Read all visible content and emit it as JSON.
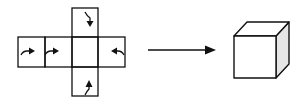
{
  "diagram": {
    "net": {
      "faces": [
        {
          "id": "top",
          "arrow": "curved-down"
        },
        {
          "id": "far-left",
          "arrow": "curved-right"
        },
        {
          "id": "left",
          "arrow": "curved-right"
        },
        {
          "id": "center",
          "arrow": "none"
        },
        {
          "id": "right",
          "arrow": "curved-left"
        },
        {
          "id": "bottom",
          "arrow": "curved-up"
        }
      ]
    },
    "transition_arrow": "right-arrow",
    "result": "cube",
    "colors": {
      "stroke": "#111111",
      "shade": "#e6e6e6",
      "background": "#ffffff"
    }
  }
}
